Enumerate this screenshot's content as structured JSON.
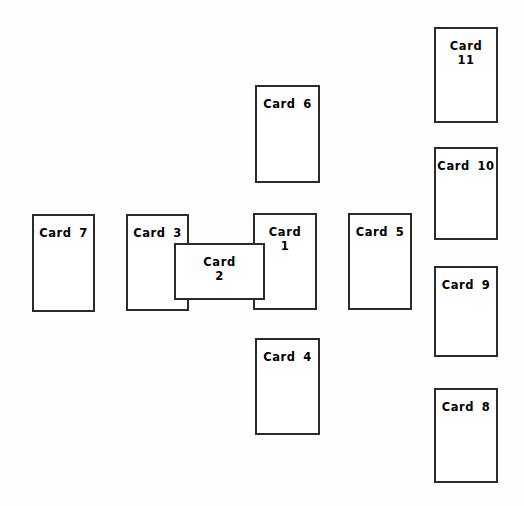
{
  "canvas": {
    "width": 524,
    "height": 506,
    "background_color": "#fefefe",
    "card_fill_color": "#ffffff",
    "card_border_color": "#2b2b2b",
    "label_color": "#000000"
  },
  "cards": [
    {
      "id": "card-1",
      "label": "Card\n1",
      "label_lines": 2,
      "x": 253,
      "y": 213,
      "width": 64,
      "height": 97,
      "z": 2
    },
    {
      "id": "card-2",
      "label": "Card\n2",
      "label_lines": 2,
      "x": 174,
      "y": 243,
      "width": 91,
      "height": 57,
      "z": 3
    },
    {
      "id": "card-3",
      "label": "Card 3",
      "label_lines": 1,
      "x": 126,
      "y": 214,
      "width": 63,
      "height": 97,
      "z": 2
    },
    {
      "id": "card-4",
      "label": "Card 4",
      "label_lines": 1,
      "x": 255,
      "y": 338,
      "width": 65,
      "height": 97,
      "z": 1
    },
    {
      "id": "card-5",
      "label": "Card 5",
      "label_lines": 1,
      "x": 348,
      "y": 213,
      "width": 64,
      "height": 97,
      "z": 1
    },
    {
      "id": "card-6",
      "label": "Card 6",
      "label_lines": 1,
      "x": 255,
      "y": 85,
      "width": 65,
      "height": 98,
      "z": 1
    },
    {
      "id": "card-7",
      "label": "Card 7",
      "label_lines": 1,
      "x": 32,
      "y": 214,
      "width": 63,
      "height": 98,
      "z": 1
    },
    {
      "id": "card-8",
      "label": "Card 8",
      "label_lines": 1,
      "x": 434,
      "y": 388,
      "width": 64,
      "height": 95,
      "z": 1
    },
    {
      "id": "card-9",
      "label": "Card 9",
      "label_lines": 1,
      "x": 434,
      "y": 266,
      "width": 64,
      "height": 91,
      "z": 1
    },
    {
      "id": "card-10",
      "label": "Card 10",
      "label_lines": 1,
      "x": 434,
      "y": 147,
      "width": 64,
      "height": 93,
      "z": 1
    },
    {
      "id": "card-11",
      "label": "Card\n11",
      "label_lines": 2,
      "x": 434,
      "y": 27,
      "width": 64,
      "height": 96,
      "z": 1
    }
  ]
}
